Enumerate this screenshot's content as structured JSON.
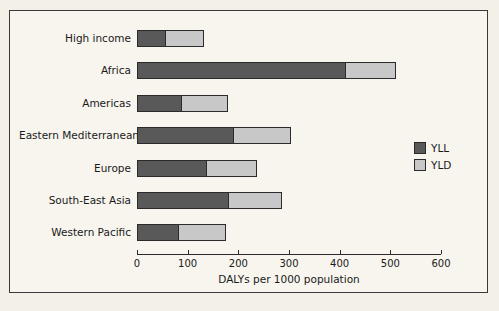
{
  "chart_data": {
    "type": "bar",
    "orientation": "horizontal",
    "stacked": true,
    "title": "",
    "xlabel": "DALYs per 1000 population",
    "ylabel": "",
    "xlim": [
      0,
      600
    ],
    "xticks": [
      0,
      100,
      200,
      300,
      400,
      500,
      600
    ],
    "xtick_labels": [
      "0",
      "100",
      "200",
      "300",
      "400",
      "500",
      "600"
    ],
    "grid": false,
    "legend_position": "right",
    "categories": [
      "High income",
      "Africa",
      "Americas",
      "Eastern Mediterranean",
      "Europe",
      "South-East Asia",
      "Western Pacific"
    ],
    "series": [
      {
        "name": "YLL",
        "color": "#595959",
        "values": [
          58,
          413,
          88,
          191,
          138,
          181,
          83
        ]
      },
      {
        "name": "YLD",
        "color": "#c8c8c8",
        "values": [
          77,
          100,
          93,
          114,
          100,
          108,
          94
        ]
      }
    ],
    "totals": [
      135,
      513,
      181,
      305,
      238,
      289,
      177
    ]
  },
  "legend": {
    "items": [
      {
        "label": "YLL",
        "color": "#595959"
      },
      {
        "label": "YLD",
        "color": "#c8c8c8"
      }
    ]
  },
  "axis": {
    "x_title": "DALYs per 1000 population"
  },
  "colors": {
    "yll": "#595959",
    "yld": "#c8c8c8",
    "outline": "#2b2b2b",
    "frame": "#3a3a3a",
    "background": "#f7f5ee"
  }
}
